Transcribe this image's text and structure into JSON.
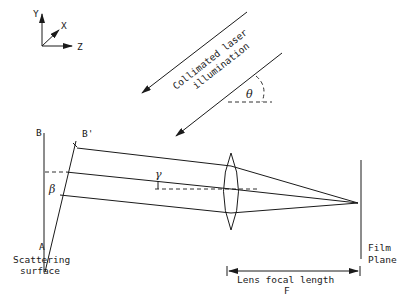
{
  "diagram": {
    "axes": {
      "y_label": "Y",
      "x_label": "X",
      "z_label": "Z"
    },
    "illumination": {
      "line1": "Collimated laser",
      "line2": "illumination",
      "angle_label": "θ"
    },
    "surface": {
      "point_b": "B",
      "point_b_prime": "B'",
      "point_a": "A",
      "tilt_angle": "β",
      "label_line1": "Scattering",
      "label_line2": "surface"
    },
    "scatter_angle": "γ",
    "film": {
      "line1": "Film",
      "line2": "Plane"
    },
    "focal": {
      "line1": "Lens focal length",
      "line2": "F"
    }
  }
}
